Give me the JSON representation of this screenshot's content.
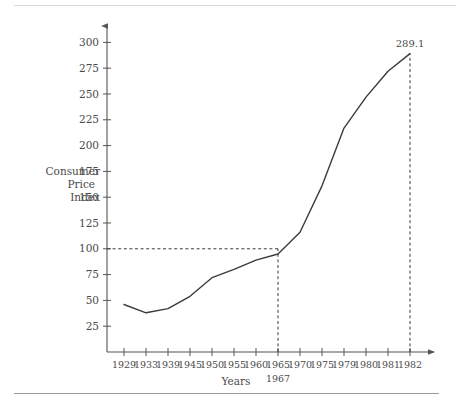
{
  "chart_data": {
    "type": "line",
    "title": "",
    "xlabel": "Years",
    "ylabel": "Consumer Price Index",
    "ylabel_lines": [
      "Consumer",
      "Price",
      "Index"
    ],
    "categories": [
      "1929",
      "1933",
      "1939",
      "1945",
      "1950",
      "1955",
      "1960",
      "1965",
      "1970",
      "1975",
      "1979",
      "1980",
      "1981",
      "1982"
    ],
    "values": [
      46,
      38,
      42,
      54,
      72,
      80,
      89,
      95,
      116,
      161,
      217,
      247,
      272,
      289.1
    ],
    "series": [
      {
        "name": "Consumer Price Index",
        "values": [
          46,
          38,
          42,
          54,
          72,
          80,
          89,
          95,
          116,
          161,
          217,
          247,
          272,
          289.1
        ]
      }
    ],
    "ylim": [
      0,
      312
    ],
    "yticks": [
      25,
      50,
      75,
      100,
      125,
      150,
      175,
      200,
      225,
      250,
      275,
      300
    ],
    "ytick_labels": [
      "25",
      "50",
      "75",
      "100",
      "125",
      "150",
      "175",
      "200",
      "225",
      "250",
      "275",
      "300"
    ],
    "xtick_labels": [
      "1929",
      "1933",
      "1939",
      "1945",
      "1950",
      "1955",
      "1960",
      "1965",
      "1970",
      "1975",
      "1979",
      "1980",
      "1981",
      "1982"
    ],
    "grid": false,
    "legend": "none",
    "annotations": [
      {
        "name": "end-value-label",
        "text": "289.1",
        "category": "1982",
        "value": 289.1
      },
      {
        "name": "base-year-sublabel",
        "text": "1967",
        "category": "1965"
      }
    ],
    "reference_lines": [
      {
        "name": "base-index-horizontal",
        "orientation": "horizontal",
        "value": 100,
        "from_category": "1929",
        "to_category": "1965",
        "style": "dashed"
      },
      {
        "name": "base-year-vertical",
        "orientation": "vertical",
        "category": "1965",
        "from_value": 0,
        "to_value": 100,
        "style": "dashed"
      },
      {
        "name": "end-year-vertical",
        "orientation": "vertical",
        "category": "1982",
        "from_value": 0,
        "to_value": 289.1,
        "style": "dashed"
      }
    ],
    "colors": {
      "line": "#3b3b3b",
      "axis": "#555555",
      "text": "#4a4a4a",
      "background": "#ffffff"
    }
  }
}
